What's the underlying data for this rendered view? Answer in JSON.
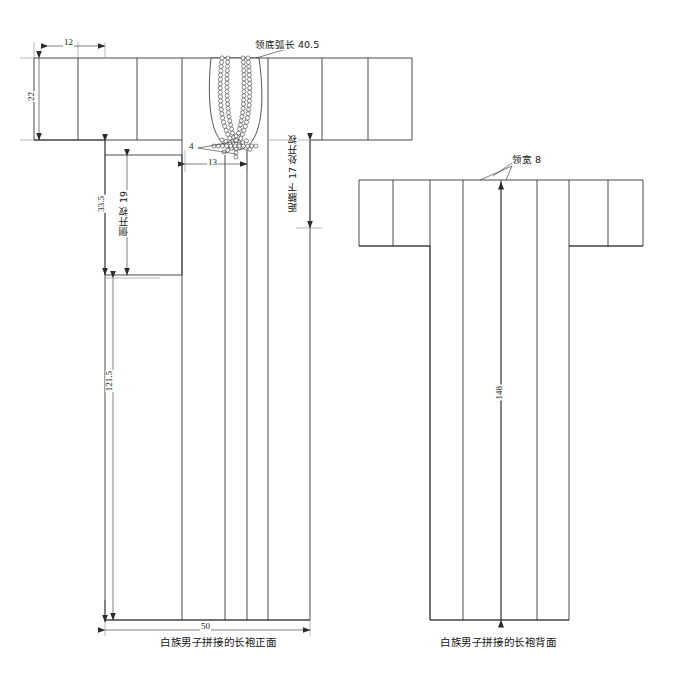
{
  "figure": {
    "title_front": "白族男子拼接的长袍正面",
    "title_back": "白族男子拼接的长袍背面"
  },
  "front_view": {
    "dimensions": {
      "sleeve_cuff_width": "12",
      "sleeve_height": "22",
      "armhole_to_slit_top": "33.5",
      "side_slit": "侧开衩 19",
      "body_length": "121.5",
      "front_placket_width": "13",
      "placket_overlap": "4",
      "hem_width": "50",
      "slit_note": "距腋下 17 处开衩",
      "collar_arc": "领底弧长 40.5"
    }
  },
  "back_view": {
    "dimensions": {
      "collar_width": "领宽 8",
      "center_back_length": "148"
    }
  },
  "style": {
    "line_color": "#2b2b2b",
    "dim_line_color": "#8a8a8a",
    "background": "#ffffff"
  }
}
